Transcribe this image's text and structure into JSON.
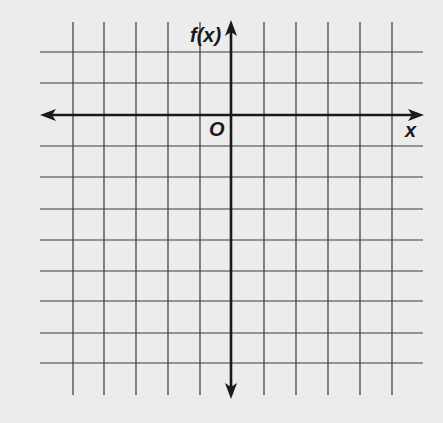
{
  "diagram": {
    "type": "coordinate-grid",
    "y_axis_label": "f(x)",
    "x_axis_label": "x",
    "origin_label": "O",
    "background_color": "#ececec",
    "line_color": "#3a3a3a",
    "axis_color": "#1a1a1a",
    "grid": {
      "vertical_lines_x": [
        73,
        104,
        136,
        168,
        200,
        264,
        296,
        328,
        360,
        392
      ],
      "horizontal_lines_y": [
        52,
        83,
        146,
        177,
        209,
        240,
        271,
        301,
        333,
        363
      ],
      "vertical_extent": [
        22,
        395
      ],
      "horizontal_extent": [
        40,
        423
      ],
      "columns": 12,
      "rows": 11
    },
    "axes": {
      "x_axis_y": 115,
      "y_axis_x": 231,
      "x_arrows": "both",
      "y_arrows": "both"
    }
  }
}
